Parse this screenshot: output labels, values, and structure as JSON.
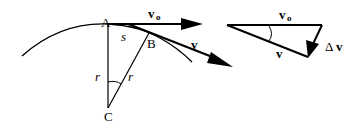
{
  "diagram": {
    "points": {
      "A": "A",
      "B": "B",
      "C": "C"
    },
    "labels": {
      "arc_length": "s",
      "radius_left": "r",
      "radius_right": "r",
      "v0": "v",
      "v0_subscript": "o",
      "v": "v",
      "triangle_v0": "v",
      "triangle_v0_subscript": "o",
      "triangle_v": "v",
      "delta_v_symbol": "Δ",
      "delta_v": "v"
    },
    "colors": {
      "stroke": "#000000",
      "background": "#ffffff"
    }
  }
}
